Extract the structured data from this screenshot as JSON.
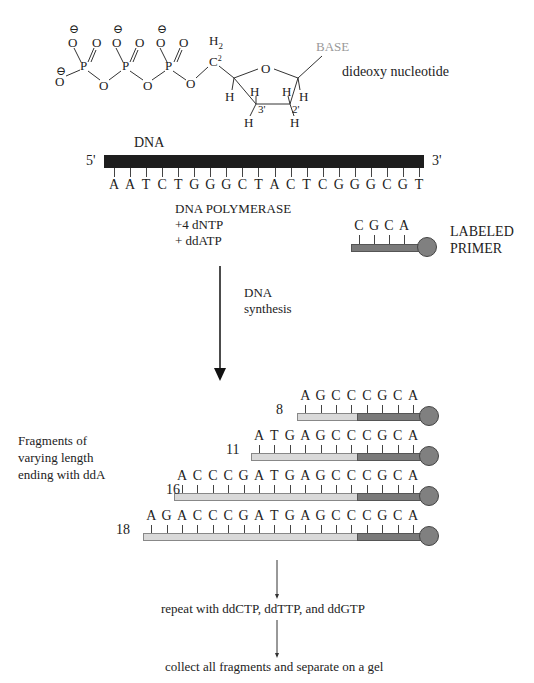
{
  "molecule": {
    "label": "dideoxy nucleotide",
    "base_label": "BASE",
    "atoms": {
      "phosphates": [
        "P",
        "P",
        "P"
      ],
      "oxygens_label": "O",
      "charge": "⊖",
      "ch2": "C",
      "ch2_sub": "2",
      "h2_label": "H",
      "ring_o": "O",
      "h": "H",
      "c3_label": "3'",
      "c2_label": "2'"
    }
  },
  "template": {
    "label": "DNA",
    "five_prime": "5'",
    "three_prime": "3'",
    "bar_color": "#1e1e1e",
    "sequence": [
      "A",
      "A",
      "T",
      "C",
      "T",
      "G",
      "G",
      "G",
      "C",
      "T",
      "A",
      "C",
      "T",
      "C",
      "G",
      "G",
      "G",
      "C",
      "G",
      "T"
    ]
  },
  "reagents": {
    "line1": "DNA POLYMERASE",
    "line2": "+4 dNTP",
    "line3": "+ ddATP"
  },
  "primer": {
    "label_line1": "LABELED",
    "label_line2": "PRIMER",
    "sequence": [
      "C",
      "G",
      "C",
      "A"
    ],
    "bar_color": "#7a7a7a",
    "label_dot_color": "#7f7f7f"
  },
  "step": {
    "line1": "DNA",
    "line2": "synthesis"
  },
  "fragments_label": {
    "line1": "Fragments of",
    "line2": "varying length",
    "line3": "ending with ddA"
  },
  "fragments": [
    {
      "length": "8",
      "sequence": [
        "A",
        "G",
        "C",
        "C",
        "C",
        "G",
        "C",
        "A"
      ]
    },
    {
      "length": "11",
      "sequence": [
        "A",
        "T",
        "G",
        "A",
        "G",
        "C",
        "C",
        "C",
        "G",
        "C",
        "A"
      ]
    },
    {
      "length": "16",
      "sequence": [
        "A",
        "C",
        "C",
        "C",
        "G",
        "A",
        "T",
        "G",
        "A",
        "G",
        "C",
        "C",
        "C",
        "G",
        "C",
        "A"
      ]
    },
    {
      "length": "18",
      "sequence": [
        "A",
        "G",
        "A",
        "C",
        "C",
        "C",
        "G",
        "A",
        "T",
        "G",
        "A",
        "G",
        "C",
        "C",
        "C",
        "G",
        "C",
        "A"
      ]
    }
  ],
  "colors": {
    "new_strand": "#d9d9d9",
    "primer_strand": "#7a7a7a",
    "label_dot": "#808080"
  },
  "footer": {
    "step1": "repeat with ddCTP, ddTTP, and ddGTP",
    "step2": "collect all fragments and separate on a gel"
  }
}
